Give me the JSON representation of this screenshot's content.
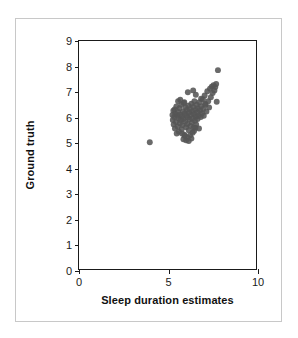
{
  "chart_data": {
    "type": "scatter",
    "title": "",
    "xlabel": "Sleep duration estimates",
    "ylabel": "Ground truth",
    "xlim": [
      0,
      10
    ],
    "ylim": [
      0,
      9
    ],
    "grid": false,
    "legend": null,
    "x_ticks": [
      0,
      5,
      10
    ],
    "x_tick_labels": [
      "0",
      "5",
      "10"
    ],
    "x_minor_ticks": [],
    "y_ticks": [
      0,
      1,
      2,
      3,
      4,
      5,
      6,
      7,
      8,
      9
    ],
    "y_tick_labels": [
      "0",
      "1",
      "2",
      "3",
      "4",
      "5",
      "6",
      "7",
      "8",
      "9"
    ],
    "marker": {
      "shape": "circle",
      "color": "#555555",
      "size_px": 6,
      "opacity": 0.88
    },
    "series": [
      {
        "name": "observations",
        "points": [
          [
            4.0,
            5.0
          ],
          [
            5.28,
            6.08
          ],
          [
            5.3,
            5.88
          ],
          [
            5.33,
            6.25
          ],
          [
            5.35,
            5.7
          ],
          [
            5.38,
            6.0
          ],
          [
            5.4,
            6.3
          ],
          [
            5.42,
            5.55
          ],
          [
            5.45,
            6.12
          ],
          [
            5.48,
            5.8
          ],
          [
            5.5,
            6.42
          ],
          [
            5.52,
            5.35
          ],
          [
            5.55,
            6.05
          ],
          [
            5.58,
            5.62
          ],
          [
            5.6,
            6.2
          ],
          [
            5.62,
            5.95
          ],
          [
            5.65,
            5.42
          ],
          [
            5.68,
            6.35
          ],
          [
            5.7,
            5.75
          ],
          [
            5.72,
            6.1
          ],
          [
            5.75,
            5.88
          ],
          [
            5.78,
            6.48
          ],
          [
            5.8,
            5.52
          ],
          [
            5.82,
            6.02
          ],
          [
            5.85,
            5.68
          ],
          [
            5.88,
            6.22
          ],
          [
            5.9,
            5.92
          ],
          [
            5.92,
            6.55
          ],
          [
            5.95,
            5.3
          ],
          [
            5.98,
            6.15
          ],
          [
            6.0,
            5.82
          ],
          [
            6.02,
            6.38
          ],
          [
            6.05,
            5.6
          ],
          [
            6.08,
            6.05
          ],
          [
            6.1,
            6.28
          ],
          [
            6.12,
            5.72
          ],
          [
            6.15,
            5.98
          ],
          [
            6.18,
            6.45
          ],
          [
            6.2,
            5.48
          ],
          [
            6.22,
            6.18
          ],
          [
            6.25,
            5.9
          ],
          [
            6.28,
            6.32
          ],
          [
            6.3,
            5.65
          ],
          [
            6.32,
            6.08
          ],
          [
            6.35,
            6.52
          ],
          [
            6.38,
            5.78
          ],
          [
            6.4,
            6.22
          ],
          [
            6.42,
            5.95
          ],
          [
            6.45,
            6.4
          ],
          [
            6.48,
            5.58
          ],
          [
            6.5,
            6.12
          ],
          [
            6.52,
            6.62
          ],
          [
            6.55,
            5.85
          ],
          [
            6.58,
            6.28
          ],
          [
            6.6,
            6.02
          ],
          [
            6.62,
            5.7
          ],
          [
            6.65,
            6.48
          ],
          [
            6.68,
            6.18
          ],
          [
            6.7,
            5.92
          ],
          [
            6.72,
            6.35
          ],
          [
            6.75,
            6.05
          ],
          [
            6.78,
            5.55
          ],
          [
            6.8,
            6.58
          ],
          [
            6.85,
            6.25
          ],
          [
            6.88,
            6.0
          ],
          [
            6.9,
            6.42
          ],
          [
            6.95,
            6.15
          ],
          [
            7.0,
            6.7
          ],
          [
            7.02,
            6.32
          ],
          [
            7.05,
            6.05
          ],
          [
            7.1,
            6.85
          ],
          [
            7.15,
            6.48
          ],
          [
            7.2,
            6.22
          ],
          [
            7.25,
            7.02
          ],
          [
            7.3,
            6.62
          ],
          [
            7.35,
            6.38
          ],
          [
            7.4,
            7.12
          ],
          [
            7.45,
            6.78
          ],
          [
            7.5,
            7.2
          ],
          [
            7.55,
            6.95
          ],
          [
            7.6,
            7.25
          ],
          [
            7.65,
            7.05
          ],
          [
            7.7,
            7.18
          ],
          [
            7.75,
            7.3
          ],
          [
            7.78,
            6.6
          ],
          [
            7.85,
            7.85
          ],
          [
            6.05,
            5.08
          ],
          [
            6.12,
            5.2
          ],
          [
            6.2,
            5.05
          ],
          [
            6.28,
            5.28
          ],
          [
            5.98,
            5.25
          ],
          [
            6.35,
            5.15
          ],
          [
            6.42,
            5.38
          ],
          [
            5.9,
            5.12
          ],
          [
            6.5,
            5.45
          ],
          [
            6.58,
            5.58
          ],
          [
            5.82,
            5.35
          ],
          [
            6.15,
            6.98
          ],
          [
            6.45,
            7.05
          ],
          [
            5.95,
            6.58
          ],
          [
            6.6,
            6.88
          ],
          [
            5.72,
            6.68
          ],
          [
            6.9,
            6.72
          ],
          [
            7.12,
            6.52
          ],
          [
            5.6,
            6.62
          ]
        ]
      }
    ]
  },
  "axes": {
    "xlabel": "Sleep duration estimates",
    "ylabel": "Ground truth"
  }
}
